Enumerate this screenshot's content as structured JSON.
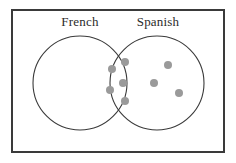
{
  "figure": {
    "background_color": "#ffffff",
    "universe_rect": {
      "x": 12,
      "y": 10,
      "width": 212,
      "height": 142,
      "stroke_color": "#3a3a3a",
      "stroke_width": 2
    }
  },
  "labels": {
    "left": "French",
    "right": "Spanish"
  },
  "chart_data": {
    "type": "venn",
    "title": "",
    "set_labels": [
      "French",
      "Spanish"
    ],
    "counts": {
      "french_only": 0,
      "spanish_only": 3,
      "both": 5,
      "neither": 0,
      "total_dots": 8
    },
    "dot_style": {
      "fill": "#9a9a9a",
      "radius": 4
    },
    "circles": [
      {
        "name": "French",
        "cx": 80,
        "cy": 83,
        "r": 47,
        "stroke_color": "#3a3a3a",
        "stroke_width": 1,
        "fill": "none",
        "label_x": 80,
        "label_y": 26
      },
      {
        "name": "Spanish",
        "cx": 157,
        "cy": 83,
        "r": 47,
        "stroke_color": "#3a3a3a",
        "stroke_width": 1,
        "fill": "none",
        "label_x": 158,
        "label_y": 26
      }
    ],
    "dots": [
      {
        "region": "both",
        "cx": 125,
        "cy": 62
      },
      {
        "region": "both",
        "cx": 112,
        "cy": 69
      },
      {
        "region": "both",
        "cx": 123,
        "cy": 83
      },
      {
        "region": "both",
        "cx": 110,
        "cy": 90
      },
      {
        "region": "both",
        "cx": 125,
        "cy": 101
      },
      {
        "region": "spanish_only",
        "cx": 168,
        "cy": 65
      },
      {
        "region": "spanish_only",
        "cx": 154,
        "cy": 83
      },
      {
        "region": "spanish_only",
        "cx": 179,
        "cy": 93
      }
    ]
  }
}
